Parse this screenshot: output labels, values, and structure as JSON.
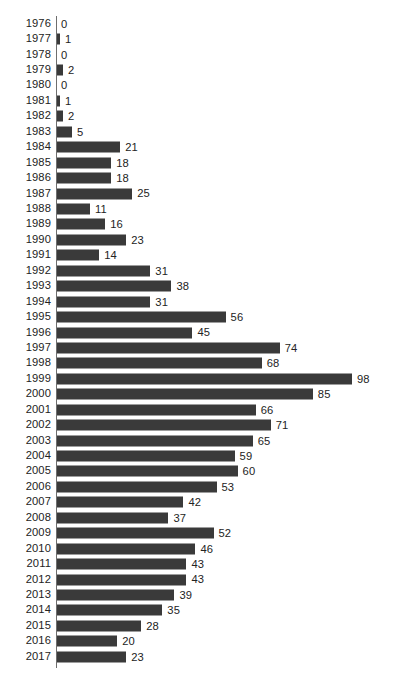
{
  "chart_data": {
    "type": "bar",
    "orientation": "horizontal",
    "title": "",
    "subtitle": "",
    "xlabel": "",
    "ylabel": "",
    "grid": false,
    "legend": null,
    "legend_position": "none",
    "value_labels": true,
    "xlim": [
      0,
      98
    ],
    "axis_spine": "category",
    "bar_color": "#3a3a3a",
    "text_color": "#232323",
    "axis_color": "#6e6e6e",
    "background_color": "#ffffff",
    "categories": [
      "1976",
      "1977",
      "1978",
      "1979",
      "1980",
      "1981",
      "1982",
      "1983",
      "1984",
      "1985",
      "1986",
      "1987",
      "1988",
      "1989",
      "1990",
      "1991",
      "1992",
      "1993",
      "1994",
      "1995",
      "1996",
      "1997",
      "1998",
      "1999",
      "2000",
      "2001",
      "2002",
      "2003",
      "2004",
      "2005",
      "2006",
      "2007",
      "2008",
      "2009",
      "2010",
      "2011",
      "2012",
      "2013",
      "2014",
      "2015",
      "2016",
      "2017"
    ],
    "values": [
      0,
      1,
      0,
      2,
      0,
      1,
      2,
      5,
      21,
      18,
      18,
      25,
      11,
      16,
      23,
      14,
      31,
      38,
      31,
      56,
      45,
      74,
      68,
      98,
      85,
      66,
      71,
      65,
      59,
      60,
      53,
      42,
      37,
      52,
      46,
      43,
      43,
      39,
      35,
      28,
      20,
      23
    ]
  },
  "caption": {
    "text": ""
  }
}
